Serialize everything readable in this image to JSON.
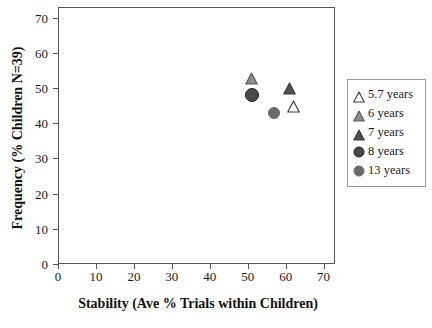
{
  "chart_data": {
    "type": "scatter",
    "title": "",
    "xlabel": "Stability (Ave % Trials within Children)",
    "ylabel": "Frequency (% Children N=39)",
    "xlim": [
      0,
      73
    ],
    "ylim": [
      0,
      73
    ],
    "xticks": [
      0,
      10,
      20,
      30,
      40,
      50,
      60,
      70
    ],
    "yticks": [
      0,
      10,
      20,
      30,
      40,
      50,
      60,
      70
    ],
    "xtick_labels": [
      "0",
      "10",
      "20",
      "30",
      "40",
      "50",
      "60",
      "70"
    ],
    "ytick_labels": [
      "0",
      "10",
      "20",
      "30",
      "40",
      "50",
      "60",
      "70"
    ],
    "grid": false,
    "legend_position": "right-outside",
    "series": [
      {
        "name": "5.7 years",
        "marker": "triangle",
        "fill": "#ffffff",
        "edge": "#3a3a3a",
        "size": 13,
        "x": [
          62
        ],
        "y": [
          45
        ]
      },
      {
        "name": "6 years",
        "marker": "triangle",
        "fill": "#8c8c8c",
        "edge": "#5a5a5a",
        "size": 13,
        "x": [
          51
        ],
        "y": [
          53
        ]
      },
      {
        "name": "7 years",
        "marker": "triangle",
        "fill": "#4f4f4f",
        "edge": "#3a3a3a",
        "size": 13,
        "x": [
          61
        ],
        "y": [
          50
        ]
      },
      {
        "name": "8 years",
        "marker": "circle",
        "fill": "#4a4a4a",
        "edge": "#1c1c1c",
        "size": 14,
        "x": [
          51
        ],
        "y": [
          48
        ]
      },
      {
        "name": "13 years",
        "marker": "circle",
        "fill": "#6a6a6a",
        "edge": "#6a6a6a",
        "size": 12,
        "x": [
          57
        ],
        "y": [
          43
        ]
      }
    ]
  },
  "axes": {
    "x_title": "Stability (Ave % Trials within Children)",
    "y_title": "Frequency (% Children N=39)",
    "x_tick_labels": [
      "0",
      "10",
      "20",
      "30",
      "40",
      "50",
      "60",
      "70"
    ],
    "y_tick_labels": [
      "0",
      "10",
      "20",
      "30",
      "40",
      "50",
      "60",
      "70"
    ]
  },
  "legend": {
    "items": [
      {
        "label": "5.7 years",
        "marker": "triangle-open"
      },
      {
        "label": "6 years",
        "marker": "triangle-light"
      },
      {
        "label": "7 years",
        "marker": "triangle-dark"
      },
      {
        "label": "8 years",
        "marker": "circle-outlined"
      },
      {
        "label": "13 years",
        "marker": "circle-gray"
      }
    ]
  },
  "colors": {
    "frame": "#555555",
    "text": "#1a1a1a",
    "legend_border": "#9a9a9a",
    "background": "#ffffff"
  }
}
